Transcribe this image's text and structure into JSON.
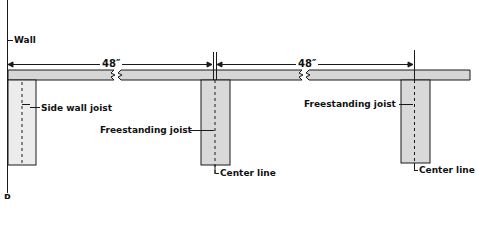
{
  "diagram": {
    "labels": {
      "wall": "Wall",
      "side_wall_joist": "Side wall joist",
      "freestanding_joist_1": "Freestanding joist",
      "freestanding_joist_2": "Freestanding joist",
      "center_line_1": "Center line",
      "center_line_2": "Center line",
      "corner_letter": "P"
    },
    "dimensions": {
      "span_1": "48″",
      "span_2": "48″"
    },
    "colors": {
      "beam_fill": "#d6d6d6",
      "joist_fill": "#d9d9d9",
      "line": "#1a1a1a",
      "background": "#ffffff"
    }
  }
}
